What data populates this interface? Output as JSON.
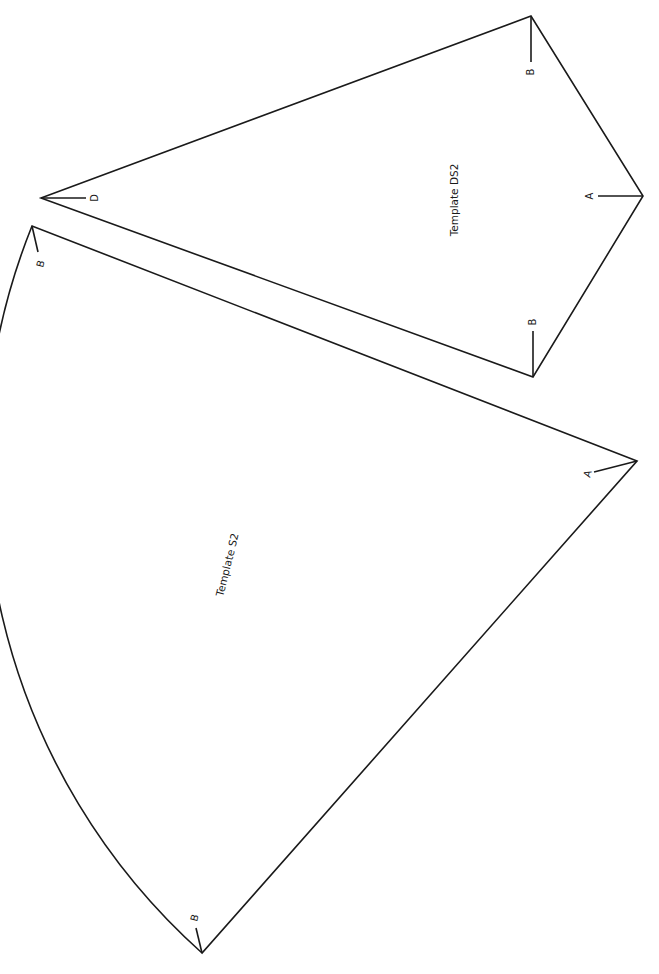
{
  "templates": [
    {
      "id": "S2",
      "title": "Template S2",
      "shape": "circular-sector",
      "vertices": {
        "apex": {
          "x": 637,
          "y": 461,
          "label": "A"
        },
        "top": {
          "x": 32,
          "y": 226,
          "label": "B"
        },
        "bottom": {
          "x": 202,
          "y": 953,
          "label": "B"
        }
      },
      "arc_radius": 650
    },
    {
      "id": "DS2",
      "title": "Template DS2",
      "shape": "kite",
      "vertices": {
        "apex": {
          "x": 41,
          "y": 198,
          "label": "D"
        },
        "top": {
          "x": 531,
          "y": 16,
          "label": "B"
        },
        "right": {
          "x": 643,
          "y": 196,
          "label": "A"
        },
        "bottom": {
          "x": 533,
          "y": 377,
          "label": "B"
        }
      }
    }
  ],
  "labels": {
    "s2_title": "Template S2",
    "ds2_title": "Template DS2",
    "s2_apex": "A",
    "s2_top": "B",
    "s2_bottom": "B",
    "ds2_apex": "D",
    "ds2_top": "B",
    "ds2_right": "A",
    "ds2_bottom": "B"
  },
  "colors": {
    "line": "#1a1a1a",
    "background": "#ffffff"
  }
}
